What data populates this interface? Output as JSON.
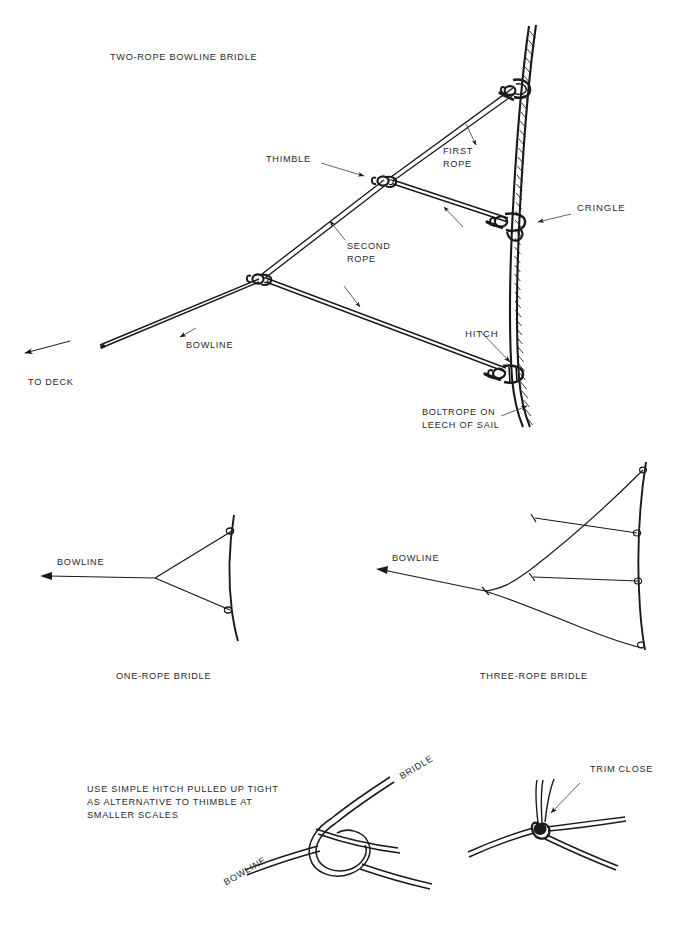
{
  "figure": {
    "title": "TWO-ROPE BOWLINE BRIDLE",
    "background": "#ffffff",
    "ink": "#1a1a1a",
    "text_color": "#2b2b2b"
  },
  "main_diagram": {
    "title": "TWO-ROPE BOWLINE BRIDLE",
    "labels": {
      "thimble": "THIMBLE",
      "first_rope": "FIRST\nROPE",
      "second_rope": "SECOND\nROPE",
      "cringle": "CRINGLE",
      "hitch": "HITCH",
      "bowline": "BOWLINE",
      "to_deck": "TO DECK",
      "boltrope": "BOLTROPE ON\nLEECH OF SAIL"
    }
  },
  "one_rope": {
    "caption": "ONE-ROPE BRIDLE",
    "bowline_label": "BOWLINE"
  },
  "three_rope": {
    "caption": "THREE-ROPE BRIDLE",
    "bowline_label": "BOWLINE"
  },
  "bottom_note": {
    "text": "USE SIMPLE HITCH PULLED UP TIGHT\nAS ALTERNATIVE TO THIMBLE AT\nSMALLER SCALES"
  },
  "knot_detail": {
    "bridle_label": "BRIDLE",
    "bowline_label": "BOWLINE"
  },
  "trim_detail": {
    "trim_close_label": "TRIM CLOSE"
  }
}
